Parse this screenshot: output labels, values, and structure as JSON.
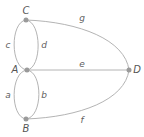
{
  "graph": {
    "vertices": [
      {
        "id": "C",
        "label": "C",
        "x": 26,
        "y": 20,
        "label_x": 26,
        "label_y": 14
      },
      {
        "id": "A",
        "label": "A",
        "x": 27,
        "y": 70,
        "label_x": 15,
        "label_y": 73
      },
      {
        "id": "B",
        "label": "B",
        "x": 26,
        "y": 119,
        "label_x": 26,
        "label_y": 132
      },
      {
        "id": "D",
        "label": "D",
        "x": 129,
        "y": 70,
        "label_x": 137,
        "label_y": 73
      }
    ],
    "edges": [
      {
        "id": "a",
        "label": "a",
        "from": "A",
        "to": "B",
        "label_x": 8,
        "label_y": 98
      },
      {
        "id": "b",
        "label": "b",
        "from": "A",
        "to": "B",
        "label_x": 44,
        "label_y": 98
      },
      {
        "id": "c",
        "label": "c",
        "from": "A",
        "to": "C",
        "label_x": 8,
        "label_y": 48
      },
      {
        "id": "d",
        "label": "d",
        "from": "A",
        "to": "C",
        "label_x": 44,
        "label_y": 48
      },
      {
        "id": "e",
        "label": "e",
        "from": "A",
        "to": "D",
        "label_x": 82,
        "label_y": 69
      },
      {
        "id": "f",
        "label": "f",
        "from": "B",
        "to": "D",
        "label_x": 82,
        "label_y": 123
      },
      {
        "id": "g",
        "label": "g",
        "from": "C",
        "to": "D",
        "label_x": 82,
        "label_y": 21
      }
    ]
  },
  "colors": {
    "edge": "#b4b4b4",
    "node": "#9a9a9a",
    "label": "#555555"
  }
}
